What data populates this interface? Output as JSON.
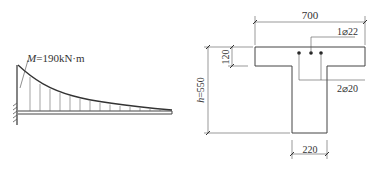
{
  "moment_diagram": {
    "label_symbol": "M",
    "label_value": "=190kN·m"
  },
  "section": {
    "flange_width": "700",
    "flange_thickness": "120",
    "height_label": "h=550",
    "web_width": "220",
    "top_rebar": "1⌀22",
    "bottom_rebar": "2⌀20"
  }
}
